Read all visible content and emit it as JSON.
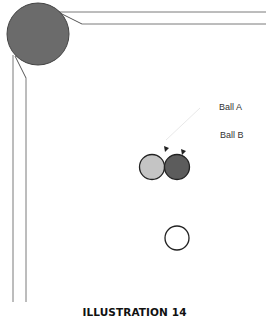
{
  "labels": {
    "ball_a": "Ball A",
    "ball_b": "Ball B"
  },
  "caption": "ILLUSTRATION 14",
  "colors": {
    "corner_pocket": "#6b6b6b",
    "ball_a": "#c4c4c4",
    "ball_b": "#5c5c5c",
    "cue_ball": "#ffffff",
    "rail_line": "#7a7a7a"
  }
}
